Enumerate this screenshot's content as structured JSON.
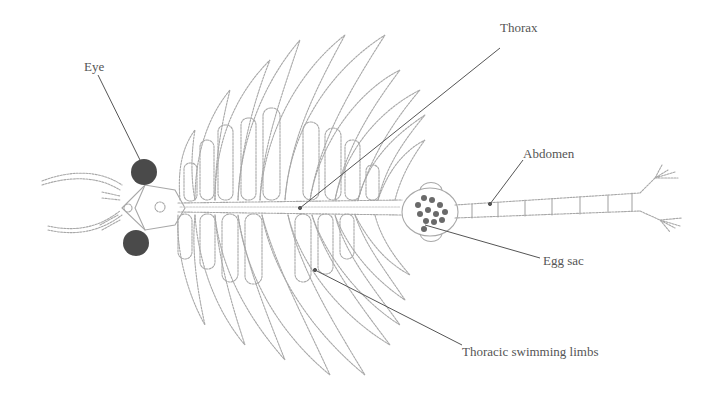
{
  "diagram": {
    "colors": {
      "background": "#ffffff",
      "outline": "#a8a8a8",
      "eye_fill": "#4a4a4a",
      "egg_fill": "#6a6a6a",
      "leader_line": "#555555",
      "label_text": "#555555"
    },
    "labels": [
      {
        "id": "eye",
        "text": "Eye",
        "x": 84,
        "y": 60
      },
      {
        "id": "thorax",
        "text": "Thorax",
        "x": 500,
        "y": 48
      },
      {
        "id": "abdomen",
        "text": "Abdomen",
        "x": 523,
        "y": 147
      },
      {
        "id": "egg-sac",
        "text": "Egg sac",
        "x": 543,
        "y": 254
      },
      {
        "id": "thoracic-limbs",
        "text": "Thoracic swimming limbs",
        "x": 462,
        "y": 345
      }
    ]
  }
}
